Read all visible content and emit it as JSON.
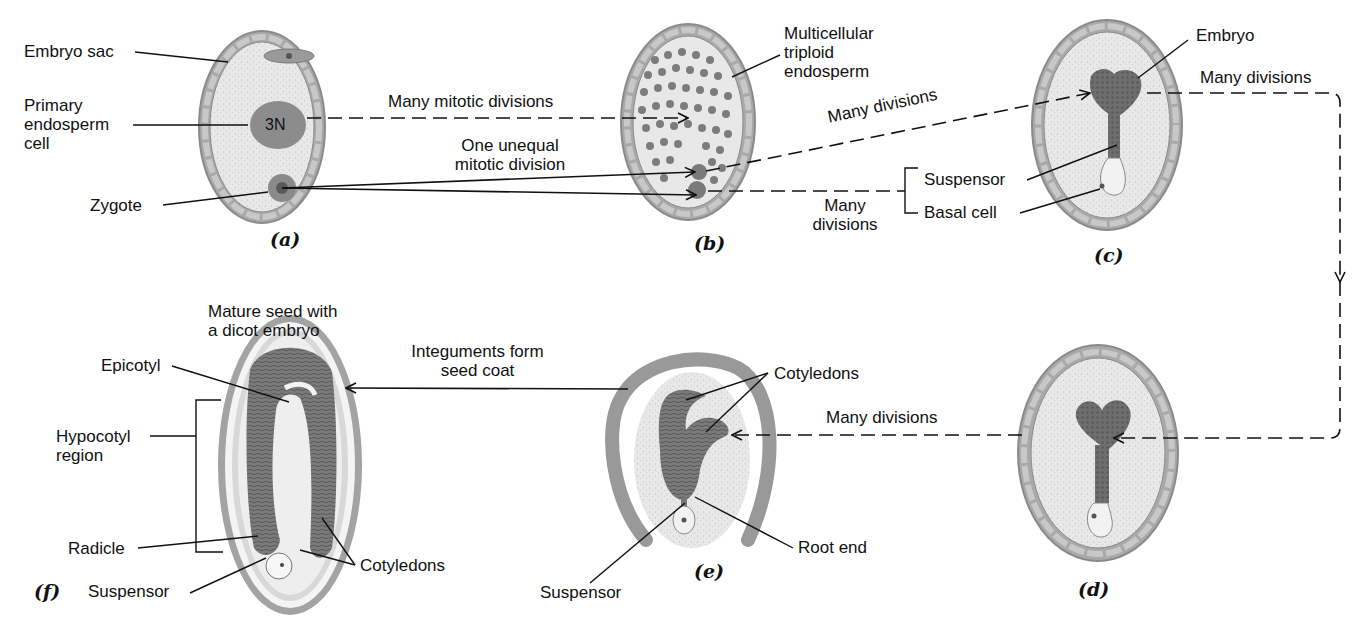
{
  "panels": {
    "a": "(a)",
    "b": "(b)",
    "c": "(c)",
    "d": "(d)",
    "e": "(e)",
    "f": "(f)"
  },
  "labels": {
    "embryo_sac": "Embryo sac",
    "primary_endosperm_cell": "Primary\nendosperm\ncell",
    "nucleus_3n": "3N",
    "zygote": "Zygote",
    "many_mitotic_divisions": "Many mitotic divisions",
    "one_unequal_mitotic_division": "One unequal\nmitotic division",
    "multicellular_triploid_endosperm": "Multicellular\ntriploid\nendosperm",
    "many_divisions_bc": "Many divisions",
    "many_divisions_basal": "Many\ndivisions",
    "suspensor_c": "Suspensor",
    "basal_cell": "Basal cell",
    "embryo": "Embryo",
    "many_divisions_cd": "Many divisions",
    "many_divisions_de": "Many divisions",
    "cotyledons_e": "Cotyledons",
    "root_end": "Root end",
    "suspensor_e": "Suspensor",
    "integuments_form_seed_coat": "Integuments form\nseed coat",
    "mature_seed": "Mature seed with\na dicot embryo",
    "epicotyl": "Epicotyl",
    "hypocotyl_region": "Hypocotyl\nregion",
    "radicle": "Radicle",
    "suspensor_f": "Suspensor",
    "cotyledons_f": "Cotyledons"
  },
  "colors": {
    "cell_wall": "#a9a9a9",
    "cell_wall_stroke": "#8a8a8a",
    "sac_fill": "#e6e6e6",
    "tissue_dark": "#6b6b6b",
    "nucleus": "#8c8c8c",
    "line": "#111111"
  }
}
